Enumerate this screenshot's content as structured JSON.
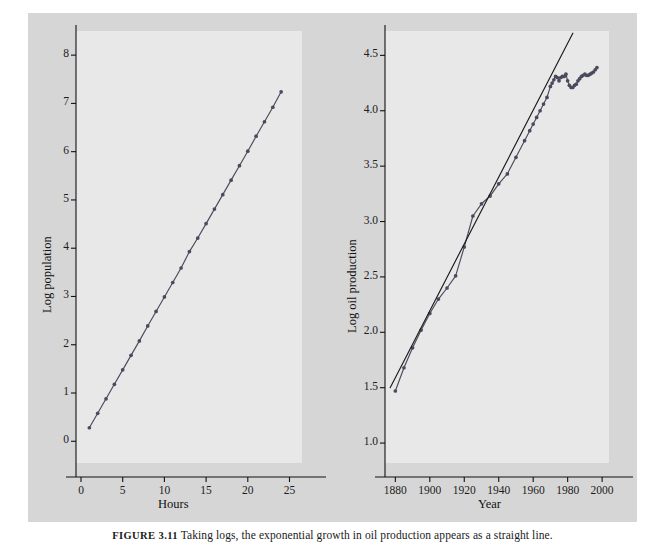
{
  "figure": {
    "caption_label": "FIGURE 3.11",
    "caption_text": "Taking logs, the exponential growth in oil production appears as a straight line.",
    "background_color": "#d6d6d6",
    "panel_color": "#e8e8e8",
    "line_color": "#4a4a5e",
    "fit_color": "#1a1a1a"
  },
  "panels": [
    {
      "id": "left",
      "xlabel": "Hours",
      "ylabel": "Log population",
      "xticks": [
        "0",
        "5",
        "10",
        "15",
        "20",
        "25"
      ],
      "yticks": [
        "0",
        "1",
        "2",
        "3",
        "4",
        "5",
        "6",
        "7",
        "8"
      ]
    },
    {
      "id": "right",
      "xlabel": "Year",
      "ylabel": "Log oil production",
      "xticks": [
        "1880",
        "1900",
        "1920",
        "1940",
        "1960",
        "1980",
        "2000"
      ],
      "yticks": [
        "1.0",
        "1.5",
        "2.0",
        "2.5",
        "3.0",
        "3.5",
        "4.0",
        "4.5"
      ]
    }
  ],
  "chart_data": [
    {
      "type": "line",
      "id": "log-population",
      "title": "",
      "xlabel": "Hours",
      "ylabel": "Log population",
      "xlim": [
        -0.6,
        26.5
      ],
      "ylim": [
        -0.45,
        8.5
      ],
      "xticks": [
        0,
        5,
        10,
        15,
        20,
        25
      ],
      "yticks": [
        0,
        1,
        2,
        3,
        4,
        5,
        6,
        7,
        8
      ],
      "grid": false,
      "legend": "none",
      "markers": true,
      "series": [
        {
          "name": "Log population",
          "x": [
            1,
            2,
            3,
            4,
            5,
            6,
            7,
            8,
            9,
            10,
            11,
            12,
            13,
            14,
            15,
            16,
            17,
            18,
            19,
            20,
            21,
            22,
            23,
            24
          ],
          "y": [
            0.28,
            0.58,
            0.88,
            1.18,
            1.48,
            1.78,
            2.08,
            2.39,
            2.69,
            2.99,
            3.29,
            3.59,
            3.93,
            4.21,
            4.51,
            4.81,
            5.11,
            5.41,
            5.71,
            6.01,
            6.32,
            6.62,
            6.92,
            7.24
          ]
        }
      ]
    },
    {
      "type": "line",
      "id": "log-oil-production",
      "title": "",
      "xlabel": "Year",
      "ylabel": "Log oil production",
      "xlim": [
        1874,
        2004
      ],
      "ylim": [
        0.82,
        4.72
      ],
      "xticks": [
        1880,
        1900,
        1920,
        1940,
        1960,
        1980,
        2000
      ],
      "yticks": [
        1.0,
        1.5,
        2.0,
        2.5,
        3.0,
        3.5,
        4.0,
        4.5
      ],
      "grid": false,
      "legend": "none",
      "markers": true,
      "series": [
        {
          "name": "Log oil production",
          "x": [
            1880,
            1885,
            1890,
            1895,
            1900,
            1905,
            1910,
            1915,
            1920,
            1925,
            1930,
            1935,
            1940,
            1945,
            1950,
            1955,
            1958,
            1960,
            1962,
            1964,
            1966,
            1968,
            1970,
            1971,
            1972,
            1973,
            1974,
            1975,
            1976,
            1977,
            1978,
            1979,
            1980,
            1981,
            1982,
            1983,
            1984,
            1985,
            1986,
            1987,
            1988,
            1989,
            1990,
            1991,
            1992,
            1993,
            1994,
            1995,
            1996,
            1997
          ],
          "y": [
            1.47,
            1.68,
            1.86,
            2.02,
            2.17,
            2.3,
            2.4,
            2.51,
            2.77,
            3.05,
            3.16,
            3.23,
            3.34,
            3.43,
            3.58,
            3.73,
            3.82,
            3.88,
            3.94,
            4.0,
            4.06,
            4.12,
            4.22,
            4.25,
            4.28,
            4.31,
            4.3,
            4.27,
            4.3,
            4.31,
            4.31,
            4.33,
            4.27,
            4.23,
            4.21,
            4.21,
            4.23,
            4.24,
            4.27,
            4.29,
            4.31,
            4.32,
            4.33,
            4.32,
            4.32,
            4.33,
            4.34,
            4.35,
            4.37,
            4.39
          ]
        },
        {
          "name": "Fitted exponential trend",
          "x": [
            1877,
            1983
          ],
          "y": [
            1.5,
            4.7
          ]
        }
      ]
    }
  ]
}
